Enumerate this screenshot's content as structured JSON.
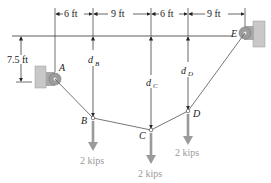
{
  "diagram": {
    "type": "cable with point loads",
    "dimensions": {
      "horizontal": [
        "6 ft",
        "9 ft",
        "6 ft",
        "9 ft"
      ],
      "vertical_A": "7.5 ft"
    },
    "points": {
      "A": "A",
      "B": "B",
      "C": "C",
      "D": "D",
      "E": "E"
    },
    "sags": {
      "dB": {
        "main": "d",
        "sub": "B"
      },
      "dC": {
        "main": "d",
        "sub": "C"
      },
      "dD": {
        "main": "d",
        "sub": "D"
      }
    },
    "loads": {
      "B": "2 kips",
      "C": "2 kips",
      "D": "2 kips"
    },
    "colors": {
      "line": "#555555",
      "load_arrow": "#9a9a9a",
      "support": "#b9b9b9"
    }
  }
}
